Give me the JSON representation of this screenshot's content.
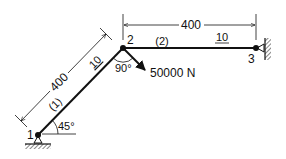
{
  "diagram": {
    "type": "two-bar truss / frame",
    "nodes": [
      {
        "id": "1",
        "label": "1",
        "support": "pinned (ground)"
      },
      {
        "id": "2",
        "label": "2",
        "support": "free"
      },
      {
        "id": "3",
        "label": "3",
        "support": "pinned (wall)"
      }
    ],
    "members": [
      {
        "id": "(1)",
        "label": "(1)",
        "from": "1",
        "to": "2",
        "length_label": "400",
        "property_label": "10",
        "angle_label": "45°"
      },
      {
        "id": "(2)",
        "label": "(2)",
        "from": "2",
        "to": "3",
        "length_label": "400",
        "property_label": "10"
      }
    ],
    "load": {
      "label": "50000 N",
      "at_node": "2",
      "angle_label": "90°"
    },
    "labels": {
      "node1": "1",
      "node2": "2",
      "node3": "3",
      "member1": "(1)",
      "member2": "(2)",
      "dim_member1": "400",
      "dim_member2": "400",
      "prop_member1": "10",
      "prop_member2": "10",
      "angle_base": "45°",
      "angle_load": "90°",
      "force": "50000 N"
    },
    "colors": {
      "line": "#111111",
      "background": "#ffffff"
    }
  }
}
